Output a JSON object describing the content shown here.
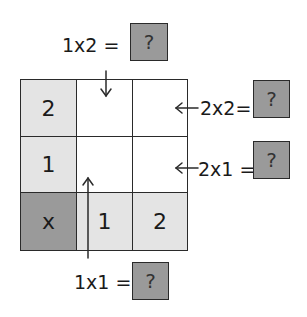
{
  "colors": {
    "light_cell": "#e4e4e4",
    "dark_cell": "#9a9a9a",
    "answer_box": "#9a9a9a",
    "line": "#2a2a2a"
  },
  "grid": {
    "rows": [
      [
        "2",
        "",
        ""
      ],
      [
        "1",
        "",
        ""
      ],
      [
        "x",
        "1",
        "2"
      ]
    ]
  },
  "questions": {
    "top": {
      "label": "1x2 =",
      "answer": "?"
    },
    "right_top": {
      "label": "2x2=",
      "answer": "?"
    },
    "right_bottom": {
      "label": "2x1 =",
      "answer": "?"
    },
    "bottom": {
      "label": "1x1 =",
      "answer": "?"
    }
  }
}
